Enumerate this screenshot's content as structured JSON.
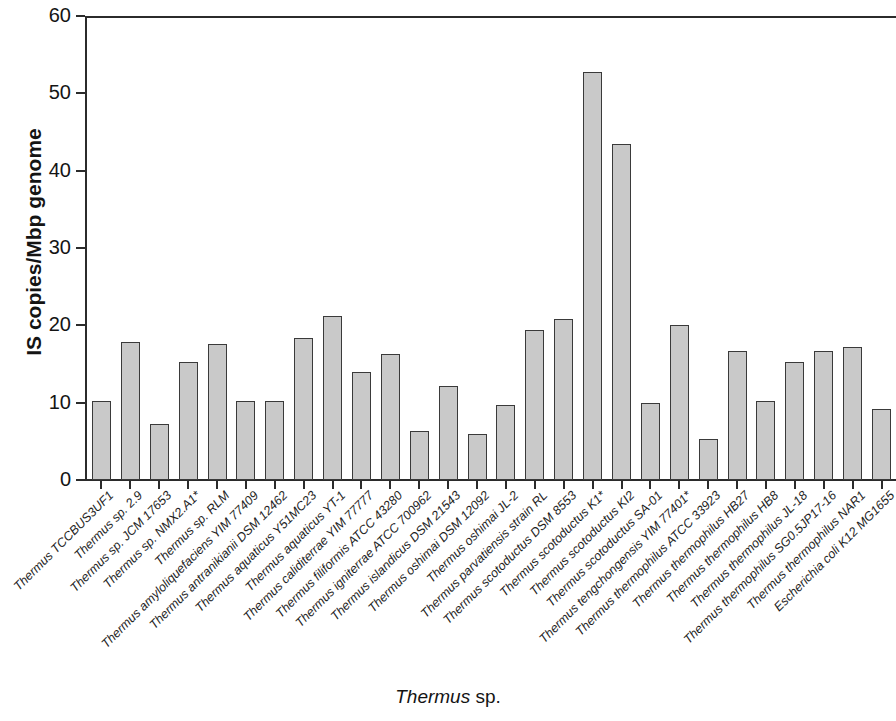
{
  "chart_data": {
    "type": "bar",
    "title": "",
    "xlabel": "Thermus sp.",
    "xlabel_italic": "Thermus",
    "xlabel_roman": " sp.",
    "ylabel": "IS copies/Mbp genome",
    "ylim": [
      0,
      60
    ],
    "yticks": [
      0,
      10,
      20,
      30,
      40,
      50,
      60
    ],
    "grid": false,
    "legend": "none",
    "bar_color": "#c9c9c9",
    "bar_edge_color": "#3a3a3a",
    "axis_color": "#2b2b2b",
    "categories": [
      "Thermus TCCBUS3UF1",
      "Thermus sp. 2.9",
      "Thermus sp. JCM 17653",
      "Thermus sp. NMX2.A1*",
      "Thermus sp. RLM",
      "Thermus amyloliquefaciens YIM 77409",
      "Thermus antranikianii DSM 12462",
      "Thermus aquaticus Y51MC23",
      "Thermus aquaticus YT-1",
      "Thermus caliditerrae YIM 77777",
      "Thermus filiformis ATCC 43280",
      "Thermus igniterrae ATCC 700962",
      "Thermus islandicus DSM 21543",
      "Thermus oshimai DSM 12092",
      "Thermus oshimai JL-2",
      "Thermus parvatiensis strain RL",
      "Thermus scotoductus DSM 8553",
      "Thermus scotoductus K1*",
      "Thermus scotoductus KI2",
      "Thermus scotoductus SA-01",
      "Thermus tengchongensis YIM 77401*",
      "Thermus thermophilus ATCC 33923",
      "Thermus thermophilus HB27",
      "Thermus thermophilus HB8",
      "Thermus thermophilus JL-18",
      "Thermus thermophilus SG0.5JP17-16",
      "Thermus thermophilus NAR1",
      "Escherichia coli K12 MG1655"
    ],
    "values": [
      10.2,
      17.8,
      7.2,
      15.2,
      17.6,
      10.2,
      10.2,
      18.4,
      21.2,
      14.0,
      16.3,
      6.3,
      12.1,
      5.9,
      9.7,
      19.4,
      20.8,
      52.8,
      43.4,
      10.0,
      20.1,
      5.3,
      16.7,
      10.2,
      15.3,
      16.7,
      17.2,
      9.2
    ]
  }
}
